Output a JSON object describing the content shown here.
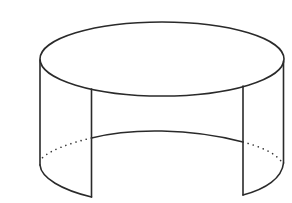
{
  "figure": {
    "description": "Line drawing of an open cylindrical band (partial cylinder surface) with a front section removed; hidden back edges of the bottom rim shown dotted",
    "stroke_color": "#2a2a2a",
    "background_color": "#ffffff",
    "shape": "partial-cylinder-surface",
    "parts": {
      "top_rim": "full ellipse",
      "left_panel": "curved wall segment on the left",
      "right_panel": "curved wall segment on the right",
      "back_bottom_edge": "visible inner bottom arc between panels",
      "hidden_edges": "dotted bottom arcs behind panels"
    }
  }
}
